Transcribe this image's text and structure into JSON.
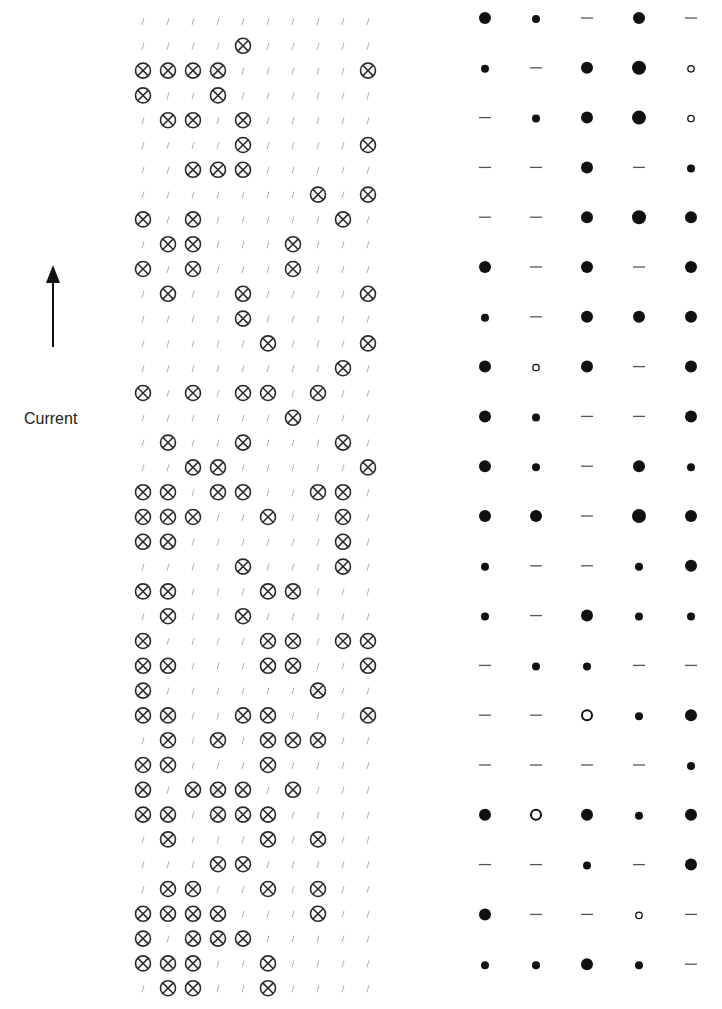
{
  "current_indicator": {
    "label": "Current",
    "arrow_direction": "up"
  },
  "symbol_grid": {
    "columns": 10,
    "rows": 40,
    "symbols": {
      "filled": "circle-cross",
      "empty": "slash"
    },
    "filled_cells_by_row": [
      [],
      [
        4
      ],
      [
        0,
        1,
        2,
        3,
        9
      ],
      [
        0,
        3
      ],
      [
        1,
        2,
        4
      ],
      [
        4,
        9
      ],
      [
        2,
        3,
        4
      ],
      [
        7,
        9
      ],
      [
        0,
        2,
        8
      ],
      [
        1,
        2,
        6
      ],
      [
        0,
        2,
        6
      ],
      [
        1,
        4,
        9
      ],
      [
        4
      ],
      [
        5,
        9
      ],
      [
        8
      ],
      [
        0,
        2,
        4,
        5,
        7
      ],
      [
        6
      ],
      [
        1,
        4,
        8
      ],
      [
        2,
        3,
        9
      ],
      [
        0,
        1,
        3,
        4,
        7,
        8
      ],
      [
        0,
        1,
        2,
        5,
        8
      ],
      [
        0,
        1,
        8
      ],
      [
        4,
        8
      ],
      [
        0,
        1,
        5,
        6
      ],
      [
        1,
        4
      ],
      [
        0,
        5,
        6,
        8,
        9
      ],
      [
        0,
        1,
        5,
        6,
        9
      ],
      [
        0,
        7
      ],
      [
        0,
        1,
        4,
        5,
        9
      ],
      [
        1,
        3,
        5,
        6,
        7
      ],
      [
        0,
        1,
        5
      ],
      [
        0,
        2,
        3,
        4,
        6
      ],
      [
        0,
        1,
        3,
        4,
        5
      ],
      [
        1,
        5,
        7
      ],
      [
        3,
        4
      ],
      [
        1,
        2,
        5,
        7
      ],
      [
        0,
        1,
        2,
        3,
        7
      ],
      [
        0,
        2,
        3,
        4
      ],
      [
        0,
        1,
        2,
        5
      ],
      [
        1,
        2,
        5
      ]
    ]
  },
  "dot_grid": {
    "columns": 5,
    "rows": 20,
    "legend": {
      "L": "large filled dot",
      "M": "medium filled dot",
      "S": "small filled dot",
      "D": "dash",
      "o": "small open circle",
      "O": "medium open circle"
    },
    "cells": [
      [
        "M",
        "S",
        "D",
        "M",
        "D"
      ],
      [
        "S",
        "D",
        "M",
        "L",
        "o"
      ],
      [
        "D",
        "S",
        "M",
        "L",
        "o"
      ],
      [
        "D",
        "D",
        "M",
        "D",
        "S"
      ],
      [
        "D",
        "D",
        "M",
        "L",
        "M"
      ],
      [
        "M",
        "D",
        "M",
        "D",
        "M"
      ],
      [
        "S",
        "D",
        "M",
        "M",
        "M"
      ],
      [
        "M",
        "o",
        "M",
        "D",
        "M"
      ],
      [
        "M",
        "S",
        "D",
        "D",
        "M"
      ],
      [
        "M",
        "S",
        "D",
        "M",
        "S"
      ],
      [
        "M",
        "M",
        "D",
        "L",
        "M"
      ],
      [
        "S",
        "D",
        "D",
        "S",
        "M"
      ],
      [
        "S",
        "D",
        "M",
        "S",
        "S"
      ],
      [
        "D",
        "S",
        "S",
        "D",
        "D"
      ],
      [
        "D",
        "D",
        "O",
        "S",
        "M"
      ],
      [
        "D",
        "D",
        "D",
        "D",
        "S"
      ],
      [
        "M",
        "O",
        "M",
        "S",
        "M"
      ],
      [
        "D",
        "D",
        "S",
        "D",
        "M"
      ],
      [
        "M",
        "D",
        "D",
        "o",
        "D"
      ],
      [
        "S",
        "S",
        "M",
        "S",
        "D"
      ]
    ]
  },
  "colors": {
    "symbol": "#2a2a2a",
    "slash": "#b0b0b0",
    "dot": "#111111",
    "dash": "#555555"
  }
}
